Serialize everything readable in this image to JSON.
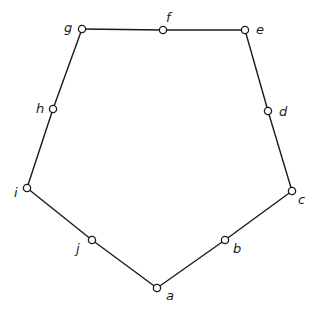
{
  "diagram": {
    "type": "polygon-graph",
    "colors": {
      "stroke": "#1a1a1a",
      "node_fill": "#ffffff",
      "background": "#ffffff"
    },
    "nodes": [
      {
        "id": "a",
        "label": "a",
        "x": 157,
        "y": 288,
        "lx": 166,
        "ly": 300
      },
      {
        "id": "b",
        "label": "b",
        "x": 225,
        "y": 240,
        "lx": 233,
        "ly": 253
      },
      {
        "id": "c",
        "label": "c",
        "x": 292,
        "y": 191,
        "lx": 298,
        "ly": 204
      },
      {
        "id": "d",
        "label": "d",
        "x": 268,
        "y": 111,
        "lx": 279,
        "ly": 116
      },
      {
        "id": "e",
        "label": "e",
        "x": 245,
        "y": 30,
        "lx": 256,
        "ly": 34
      },
      {
        "id": "f",
        "label": "f",
        "x": 163,
        "y": 30,
        "lx": 166,
        "ly": 22
      },
      {
        "id": "g",
        "label": "g",
        "x": 82,
        "y": 29,
        "lx": 64,
        "ly": 32
      },
      {
        "id": "h",
        "label": "h",
        "x": 53,
        "y": 109,
        "lx": 36,
        "ly": 113
      },
      {
        "id": "i",
        "label": "i",
        "x": 27,
        "y": 188,
        "lx": 14,
        "ly": 197
      },
      {
        "id": "j",
        "label": "j",
        "x": 92,
        "y": 240,
        "lx": 76,
        "ly": 253
      }
    ],
    "edges": [
      [
        "a",
        "b"
      ],
      [
        "b",
        "c"
      ],
      [
        "c",
        "d"
      ],
      [
        "d",
        "e"
      ],
      [
        "e",
        "f"
      ],
      [
        "f",
        "g"
      ],
      [
        "g",
        "h"
      ],
      [
        "h",
        "i"
      ],
      [
        "i",
        "j"
      ],
      [
        "j",
        "a"
      ]
    ]
  }
}
